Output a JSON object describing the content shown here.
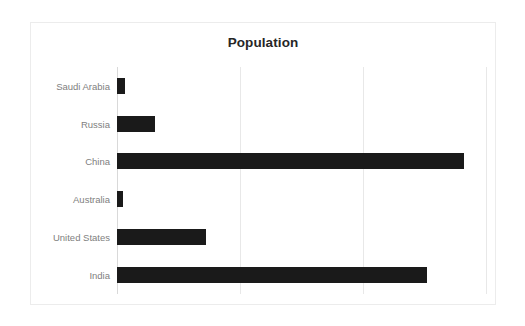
{
  "chart_data": {
    "type": "bar",
    "orientation": "horizontal",
    "title": "Population",
    "xlabel": "",
    "ylabel": "",
    "categories": [
      "Saudi Arabia",
      "Russia",
      "China",
      "Australia",
      "United States",
      "India"
    ],
    "values": [
      0.034,
      0.155,
      1.41,
      0.025,
      0.36,
      1.26
    ],
    "value_unit": "billions",
    "xlim": [
      0,
      1.5
    ],
    "xticks": [
      0,
      0.5,
      1.0,
      1.5
    ],
    "xtick_labels": [
      "",
      "",
      "",
      ""
    ],
    "grid": true,
    "legend": false,
    "series": [
      {
        "name": "Population",
        "color": "#1a1a1a",
        "values": [
          0.034,
          0.155,
          1.41,
          0.025,
          0.36,
          1.26
        ]
      }
    ],
    "bar_pixel_lengths": [
      8,
      38,
      331,
      6,
      85,
      296
    ],
    "colors": {
      "bar": "#1a1a1a",
      "grid": "#e8e8e8",
      "axis": "#d9d9d9",
      "label": "#808080",
      "title": "#262626",
      "background": "#ffffff",
      "border": "#ececec"
    }
  }
}
